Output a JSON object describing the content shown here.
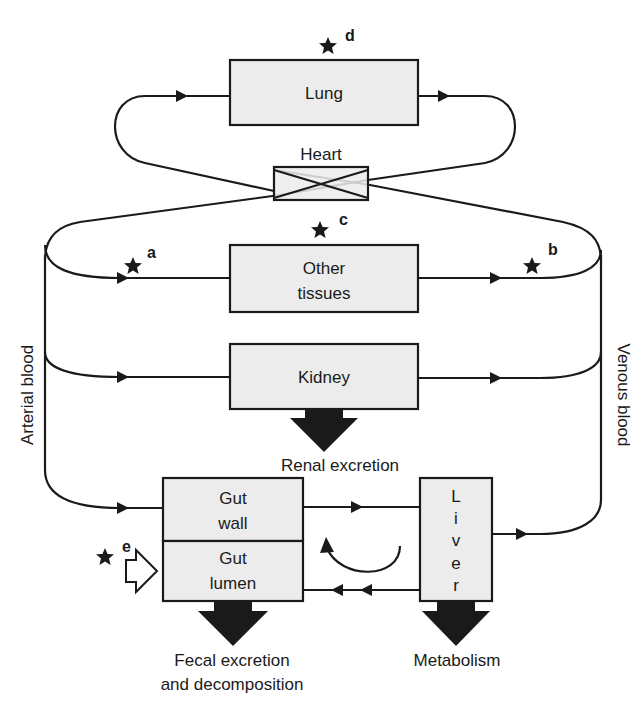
{
  "diagram": {
    "compartments": {
      "lung": "Lung",
      "heart": "Heart",
      "other_tissues_line1": "Other",
      "other_tissues_line2": "tissues",
      "kidney": "Kidney",
      "gut_wall_line1": "Gut",
      "gut_wall_line2": "wall",
      "gut_lumen_line1": "Gut",
      "gut_lumen_line2": "lumen",
      "liver_letters": [
        "L",
        "i",
        "v",
        "e",
        "r"
      ]
    },
    "side_labels": {
      "arterial": "Arterial blood",
      "venous": "Venous blood"
    },
    "outputs": {
      "renal": "Renal excretion",
      "fecal_line1": "Fecal excretion",
      "fecal_line2": "and decomposition",
      "metabolism": "Metabolism"
    },
    "markers": {
      "a": "a",
      "b": "b",
      "c": "c",
      "d": "d",
      "e": "e"
    },
    "colors": {
      "box_fill": "#ececec",
      "stroke": "#1a1a1a"
    }
  }
}
